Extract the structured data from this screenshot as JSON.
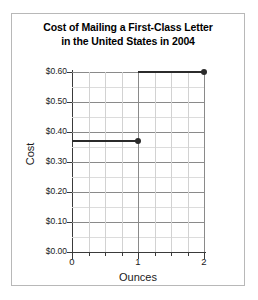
{
  "chart_data": {
    "type": "line",
    "title_lines": [
      "Cost of Mailing a First-Class Letter",
      "in the United States in 2004"
    ],
    "title": "Cost of Mailing a First-Class Letter in the United States in 2004",
    "xlabel": "Ounces",
    "ylabel": "Cost",
    "xlim": [
      0,
      2
    ],
    "ylim": [
      0.0,
      0.6
    ],
    "grid": true,
    "legend": "none",
    "x_ticks": [
      0,
      1,
      2
    ],
    "x_tick_labels": [
      "0",
      "1",
      "2"
    ],
    "x_minor_tick_step": 0.25,
    "y_ticks": [
      0.0,
      0.1,
      0.2,
      0.3,
      0.4,
      0.5,
      0.6
    ],
    "y_tick_labels": [
      "$0.00",
      "$0.10",
      "$0.20",
      "$0.30",
      "$0.40",
      "$0.50",
      "$0.60"
    ],
    "y_minor_tick_step": 0.05,
    "series": [
      {
        "name": "Cost of mailing",
        "style": "step",
        "color": "#2b2b2b",
        "segments": [
          {
            "x_start": 0,
            "x_end": 1,
            "y": 0.37,
            "endpoint_filled": true
          },
          {
            "x_start": 1,
            "x_end": 2,
            "y": 0.6,
            "endpoint_filled": true
          }
        ],
        "points": [
          {
            "x": 1,
            "y": 0.37,
            "label": "$0.37 at 1 ounce"
          },
          {
            "x": 2,
            "y": 0.6,
            "label": "$0.60 at 2 ounces"
          }
        ]
      }
    ],
    "colors": {
      "data": "#2b2b2b",
      "axis": "#3a3a3a",
      "major_grid": "#8a8a8a",
      "minor_grid": "#d2d2d2",
      "frame": "#b8b8b8",
      "background": "#ffffff"
    }
  }
}
